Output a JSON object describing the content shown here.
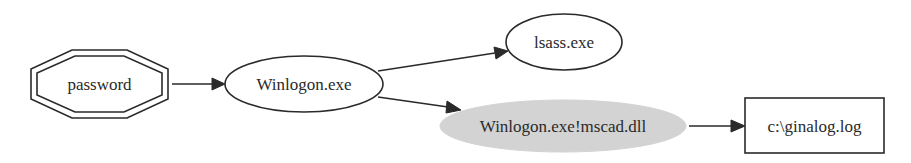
{
  "diagram": {
    "type": "directed-graph",
    "nodes": [
      {
        "id": "password",
        "label": "password",
        "shape": "doubleoctagon",
        "fill": "#ffffff"
      },
      {
        "id": "winlogon",
        "label": "Winlogon.exe",
        "shape": "ellipse",
        "fill": "#ffffff"
      },
      {
        "id": "lsass",
        "label": "lsass.exe",
        "shape": "ellipse",
        "fill": "#ffffff"
      },
      {
        "id": "mscad",
        "label": "Winlogon.exe!mscad.dll",
        "shape": "ellipse",
        "fill": "#d3d3d3"
      },
      {
        "id": "ginalog",
        "label": "c:\\ginalog.log",
        "shape": "box",
        "fill": "#ffffff"
      }
    ],
    "edges": [
      {
        "from": "password",
        "to": "winlogon"
      },
      {
        "from": "winlogon",
        "to": "lsass"
      },
      {
        "from": "winlogon",
        "to": "mscad"
      },
      {
        "from": "mscad",
        "to": "ginalog"
      }
    ]
  }
}
